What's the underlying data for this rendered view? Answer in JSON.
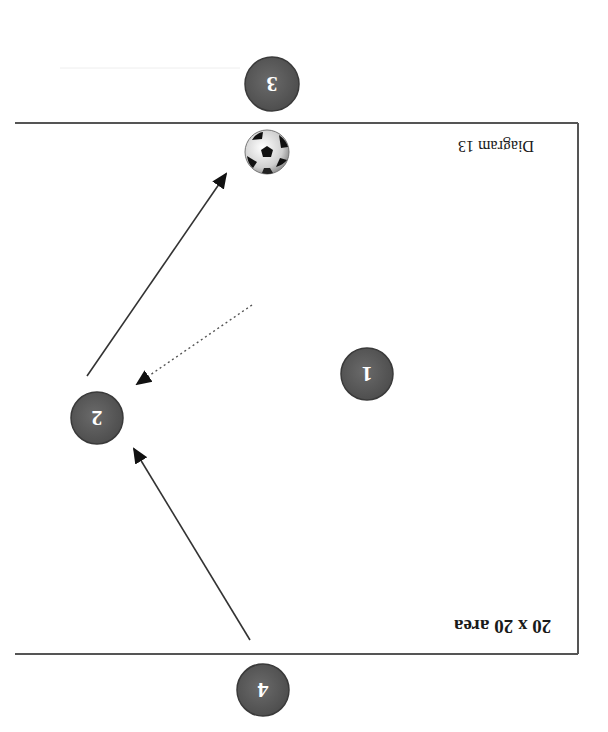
{
  "diagram": {
    "caption": "Diagram 13",
    "area_label": "20 x 20 area",
    "orientation": "rotated 180 degrees",
    "colors": {
      "player_fill": "#5a5a5a",
      "player_stroke": "#3a3a3a",
      "player_text": "#ffffff",
      "line": "#333333",
      "field_border": "#444444",
      "background": "#ffffff"
    },
    "players": [
      {
        "id": "1",
        "label": "1"
      },
      {
        "id": "2",
        "label": "2"
      },
      {
        "id": "3",
        "label": "3"
      },
      {
        "id": "4",
        "label": "4"
      }
    ],
    "ball": {
      "label": "soccer ball",
      "icon": "soccer-ball-icon"
    },
    "arrows": [
      {
        "from": "4",
        "to": "2",
        "style": "solid",
        "meaning": "pass"
      },
      {
        "from": "1",
        "to": "2",
        "style": "dotted",
        "meaning": "run"
      },
      {
        "from": "2",
        "to": "ball",
        "style": "solid",
        "meaning": "pass"
      }
    ]
  }
}
